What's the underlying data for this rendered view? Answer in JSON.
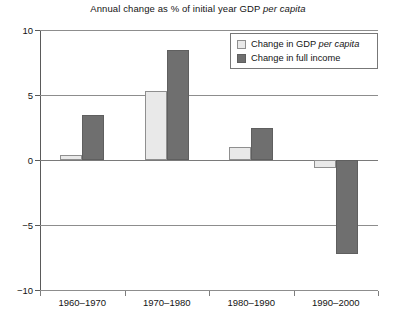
{
  "chart_data": {
    "type": "bar",
    "title": "Annual change as % of initial year GDP per capita",
    "title_plain": "Annual change as % of initial year GDP ",
    "title_italic": "per capita",
    "xlabel": "",
    "ylabel": "",
    "ylim": [
      -10,
      10
    ],
    "yticks": [
      10,
      5,
      0,
      -5,
      -10
    ],
    "ytick_labels": [
      "10",
      "5",
      "0",
      "−5",
      "−10"
    ],
    "grid": true,
    "legend_position": "top-right",
    "categories": [
      "1960–1970",
      "1970–1980",
      "1980–1990",
      "1990–2000"
    ],
    "series": [
      {
        "name": "Change in GDP per capita",
        "name_plain": "Change in GDP ",
        "name_italic": "per capita",
        "color": "#e9e9e9",
        "values": [
          0.4,
          5.3,
          1.0,
          -0.6
        ]
      },
      {
        "name": "Change in full income",
        "name_plain": "Change in full income",
        "name_italic": "",
        "color": "#6f6f6f",
        "values": [
          3.5,
          8.5,
          2.5,
          -7.2
        ]
      }
    ]
  },
  "legend": {
    "items": [
      {
        "label_plain": "Change in GDP ",
        "label_italic": "per capita",
        "swatch": "light"
      },
      {
        "label_plain": "Change in full income",
        "label_italic": "",
        "swatch": "dark"
      }
    ]
  }
}
